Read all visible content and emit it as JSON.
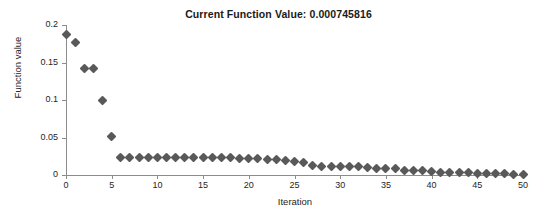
{
  "chart_data": {
    "type": "scatter",
    "title": "Current Function Value: 0.000745816",
    "xlabel": "Iteration",
    "ylabel": "Function value",
    "xlim": [
      0,
      50
    ],
    "ylim": [
      0,
      0.2
    ],
    "grid": false,
    "legend": null,
    "marker": "diamond",
    "marker_color": "#595959",
    "axis_color": "#8c8c8c",
    "background": "#ffffff",
    "xticks": [
      0,
      5,
      10,
      15,
      20,
      25,
      30,
      35,
      40,
      45,
      50
    ],
    "xtick_labels": [
      "0",
      "5",
      "10",
      "15",
      "20",
      "25",
      "30",
      "35",
      "40",
      "45",
      "50"
    ],
    "yticks": [
      0,
      0.05,
      0.1,
      0.15,
      0.2
    ],
    "ytick_labels": [
      "0",
      "0.05",
      "0.1",
      "0.15",
      "0.2"
    ],
    "x": [
      0,
      1,
      2,
      3,
      4,
      5,
      6,
      7,
      8,
      9,
      10,
      11,
      12,
      13,
      14,
      15,
      16,
      17,
      18,
      19,
      20,
      21,
      22,
      23,
      24,
      25,
      26,
      27,
      28,
      29,
      30,
      31,
      32,
      33,
      34,
      35,
      36,
      37,
      38,
      39,
      40,
      41,
      42,
      43,
      44,
      45,
      46,
      47,
      48,
      49,
      50
    ],
    "values": [
      0.187,
      0.177,
      0.142,
      0.142,
      0.1,
      0.051,
      0.0235,
      0.0235,
      0.0235,
      0.0235,
      0.0234,
      0.0234,
      0.0233,
      0.0233,
      0.0232,
      0.0231,
      0.023,
      0.0229,
      0.0227,
      0.0225,
      0.0222,
      0.0218,
      0.0213,
      0.0206,
      0.0197,
      0.0183,
      0.0163,
      0.0121,
      0.0119,
      0.0118,
      0.0117,
      0.0116,
      0.0114,
      0.0096,
      0.009,
      0.0088,
      0.0086,
      0.0062,
      0.0058,
      0.0055,
      0.0044,
      0.004,
      0.0036,
      0.0032,
      0.0027,
      0.0023,
      0.002,
      0.0017,
      0.0014,
      0.0011,
      0.000745816
    ],
    "current_function_value": 0.000745816
  }
}
